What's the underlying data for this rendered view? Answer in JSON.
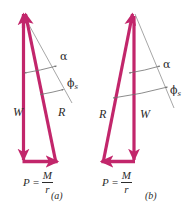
{
  "figure": {
    "colors": {
      "vector": "#c2266b",
      "vector_dark": "#a81f59",
      "guide": "#8a8a8a",
      "arc": "#6f6f6f",
      "text": "#2b2b2b",
      "background": "#ffffff"
    },
    "panels": [
      {
        "id": "a",
        "caption": "(a)",
        "vectors": [
          {
            "name": "W",
            "label": "W",
            "direction": "down",
            "label_x": 16,
            "label_y": 112
          },
          {
            "name": "R",
            "label": "R",
            "direction": "up-left",
            "label_x": 60,
            "label_y": 112
          },
          {
            "name": "P",
            "label_lead": "P =",
            "num": "M",
            "den": "r",
            "direction": "right",
            "label_x": 25,
            "label_y": 168
          }
        ],
        "angles": [
          {
            "name": "alpha",
            "symbol": "α",
            "sub": "",
            "label_x": 61,
            "label_y": 56
          },
          {
            "name": "phi_s",
            "symbol": "ϕ",
            "sub": "s",
            "label_x": 68,
            "label_y": 83
          }
        ]
      },
      {
        "id": "b",
        "caption": "(b)",
        "vectors": [
          {
            "name": "R",
            "label": "R",
            "direction": "up-right",
            "label_x": 101,
            "label_y": 114
          },
          {
            "name": "W",
            "label": "W",
            "direction": "down",
            "label_x": 142,
            "label_y": 114
          },
          {
            "name": "P",
            "label_lead": "P =",
            "num": "M",
            "den": "r",
            "direction": "left",
            "label_x": 104,
            "label_y": 170
          }
        ],
        "angles": [
          {
            "name": "alpha",
            "symbol": "α",
            "sub": "",
            "label_x": 160,
            "label_y": 64
          },
          {
            "name": "phi_s",
            "symbol": "ϕ",
            "sub": "s",
            "label_x": 166,
            "label_y": 90
          }
        ]
      }
    ],
    "captions": [
      {
        "text": "(a)",
        "x": 53,
        "y": 193
      },
      {
        "text": "(b)",
        "x": 147,
        "y": 193
      }
    ]
  }
}
